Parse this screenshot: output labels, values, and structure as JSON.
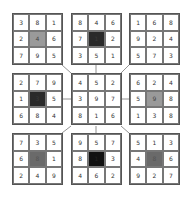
{
  "puzzle": {
    "type": "magic-square-grid",
    "blocks": [
      {
        "id": "top-left",
        "cells": [
          "3",
          "8",
          "1",
          "2",
          "4",
          "6",
          "7",
          "9",
          "5"
        ],
        "center_shade": "light"
      },
      {
        "id": "top-middle",
        "cells": [
          "8",
          "4",
          "6",
          "7",
          "1",
          "2",
          "3",
          "5",
          "1"
        ],
        "center_shade": "dark"
      },
      {
        "id": "top-right",
        "cells": [
          "1",
          "6",
          "8",
          "9",
          "2",
          "4",
          "5",
          "7",
          "3"
        ],
        "center_shade": "none"
      },
      {
        "id": "middle-left",
        "cells": [
          "2",
          "7",
          "9",
          "1",
          "3",
          "5",
          "6",
          "8",
          "4"
        ],
        "center_shade": "dark"
      },
      {
        "id": "center",
        "cells": [
          "4",
          "5",
          "2",
          "3",
          "9",
          "7",
          "8",
          "1",
          "6"
        ],
        "center_shade": "none"
      },
      {
        "id": "middle-right",
        "cells": [
          "6",
          "2",
          "4",
          "5",
          "9",
          "8",
          "1",
          "3",
          "8"
        ],
        "center_shade": "light"
      },
      {
        "id": "bottom-left",
        "cells": [
          "7",
          "3",
          "5",
          "6",
          "8",
          "1",
          "2",
          "4",
          "9"
        ],
        "center_shade": "mid"
      },
      {
        "id": "bottom-middle",
        "cells": [
          "9",
          "5",
          "7",
          "8",
          "1",
          "3",
          "4",
          "6",
          "2"
        ],
        "center_shade": "black"
      },
      {
        "id": "bottom-right",
        "cells": [
          "5",
          "1",
          "3",
          "4",
          "8",
          "6",
          "9",
          "2",
          "7"
        ],
        "center_shade": "mid"
      }
    ],
    "colors": {
      "border": "#555555",
      "shade_light": "#9a9a9a",
      "shade_mid": "#6a6a6a",
      "shade_dark": "#2a2a2a",
      "shade_black": "#111111"
    }
  }
}
